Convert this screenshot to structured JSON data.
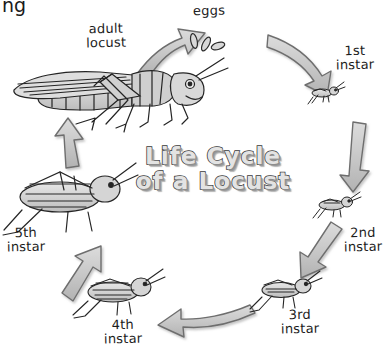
{
  "diagram": {
    "title_line1": "Life Cycle",
    "title_line2": "of a Locust",
    "corner_text": "ng",
    "background_color": "#ffffff",
    "arrow_fill": "#c9c9c9",
    "arrow_stroke": "#6e6e6e",
    "ink_color": "#1c1c1c",
    "body_fill": "#cfcfcf",
    "type": "cycle-diagram",
    "direction": "clockwise",
    "stage_count": 7
  },
  "stages": [
    {
      "id": "eggs",
      "label": "eggs",
      "icon": "locust-eggs-icon",
      "label_x": 196,
      "label_y": 6,
      "order": 1
    },
    {
      "id": "first-instar",
      "label": "1st\ninstar",
      "icon": "locust-nymph-1st-instar-icon",
      "label_x": 336,
      "label_y": 47,
      "order": 2
    },
    {
      "id": "second-instar",
      "label": "2nd\ninstar",
      "icon": "locust-nymph-2nd-instar-icon",
      "label_x": 352,
      "label_y": 229,
      "order": 3
    },
    {
      "id": "third-instar",
      "label": "3rd\ninstar",
      "icon": "locust-nymph-3rd-instar-icon",
      "label_x": 297,
      "label_y": 311,
      "order": 4
    },
    {
      "id": "fourth-instar",
      "label": "4th\ninstar",
      "icon": "locust-nymph-4th-instar-icon",
      "label_x": 123,
      "label_y": 321,
      "order": 5
    },
    {
      "id": "fifth-instar",
      "label": "5th\ninstar",
      "icon": "locust-nymph-5th-instar-icon",
      "label_x": 20,
      "label_y": 228,
      "order": 6
    },
    {
      "id": "adult-locust",
      "label": "adult\nlocust",
      "icon": "adult-locust-icon",
      "label_x": 90,
      "label_y": 22,
      "order": 7
    }
  ],
  "arrows": [
    {
      "id": "arrow-adult-to-eggs",
      "from": "adult-locust",
      "to": "eggs",
      "direction": "up-right"
    },
    {
      "id": "arrow-eggs-to-first",
      "from": "eggs",
      "to": "first-instar",
      "direction": "down-right"
    },
    {
      "id": "arrow-first-to-second",
      "from": "first-instar",
      "to": "second-instar",
      "direction": "down"
    },
    {
      "id": "arrow-second-to-third",
      "from": "second-instar",
      "to": "third-instar",
      "direction": "down-left"
    },
    {
      "id": "arrow-third-to-fourth",
      "from": "third-instar",
      "to": "fourth-instar",
      "direction": "left"
    },
    {
      "id": "arrow-fourth-to-fifth",
      "from": "fourth-instar",
      "to": "fifth-instar",
      "direction": "up-left"
    },
    {
      "id": "arrow-fifth-to-adult",
      "from": "fifth-instar",
      "to": "adult-locust",
      "direction": "up"
    }
  ]
}
